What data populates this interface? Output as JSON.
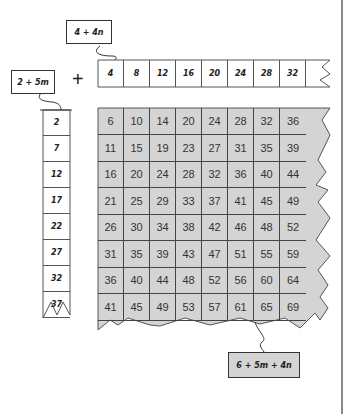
{
  "labels": {
    "top_expr": "4 + 4n",
    "left_expr": "2 + 5m",
    "result_expr": "6 + 5m + 4n",
    "plus": "+"
  },
  "top_row": [
    "4",
    "8",
    "12",
    "16",
    "20",
    "24",
    "28",
    "32"
  ],
  "left_col": [
    "2",
    "7",
    "12",
    "17",
    "22",
    "27",
    "32",
    "37"
  ],
  "grid": [
    [
      "6",
      "10",
      "14",
      "20",
      "24",
      "28",
      "32",
      "36"
    ],
    [
      "11",
      "15",
      "19",
      "23",
      "27",
      "31",
      "35",
      "39"
    ],
    [
      "16",
      "20",
      "24",
      "28",
      "32",
      "36",
      "40",
      "44"
    ],
    [
      "21",
      "25",
      "29",
      "33",
      "37",
      "41",
      "45",
      "49"
    ],
    [
      "26",
      "30",
      "34",
      "38",
      "42",
      "46",
      "48",
      "52"
    ],
    [
      "31",
      "35",
      "39",
      "43",
      "47",
      "51",
      "55",
      "59"
    ],
    [
      "36",
      "40",
      "44",
      "48",
      "52",
      "56",
      "60",
      "64"
    ],
    [
      "41",
      "45",
      "49",
      "53",
      "57",
      "61",
      "65",
      "69"
    ]
  ],
  "colors": {
    "grid_fill": "#d4d4d4",
    "line": "#444444",
    "label_fill_result": "#d4d4d4"
  }
}
